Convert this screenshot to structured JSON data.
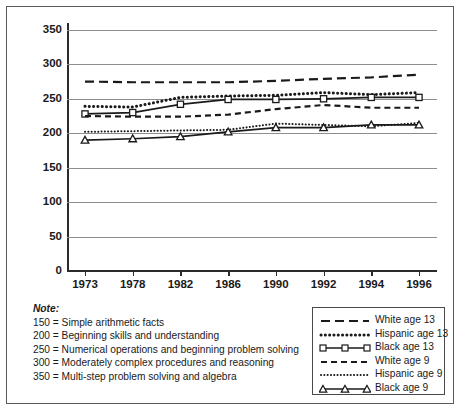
{
  "chart_data": {
    "type": "line",
    "title": "",
    "xlabel": "",
    "ylabel": "",
    "x": [
      1973,
      1978,
      1982,
      1986,
      1990,
      1992,
      1994,
      1996
    ],
    "xtick_labels": [
      "1973",
      "1978",
      "1982",
      "1986",
      "1990",
      "1992",
      "1994",
      "1996"
    ],
    "ylim": [
      0,
      360
    ],
    "ytick_labels": [
      "0",
      "50",
      "100",
      "150",
      "200",
      "250",
      "300",
      "350"
    ],
    "yticks": [
      0,
      50,
      100,
      150,
      200,
      250,
      300,
      350
    ],
    "grid": "horizontal",
    "legend_position": "bottom-right",
    "series": [
      {
        "name": "White age 13",
        "style": "long-dash",
        "marker": "none",
        "values": [
          275,
          274,
          274,
          274,
          276,
          279,
          281,
          285
        ]
      },
      {
        "name": "Hispanic age 13",
        "style": "bold-dotted",
        "marker": "none",
        "values": [
          239,
          238,
          252,
          254,
          255,
          259,
          256,
          259
        ]
      },
      {
        "name": "Black age 13",
        "style": "solid",
        "marker": "square",
        "values": [
          228,
          230,
          242,
          249,
          249,
          250,
          252,
          252
        ]
      },
      {
        "name": "White age 9",
        "style": "dashed",
        "marker": "none",
        "values": [
          225,
          224,
          224,
          227,
          235,
          241,
          237,
          237
        ]
      },
      {
        "name": "Hispanic age 9",
        "style": "fine-dotted",
        "marker": "none",
        "values": [
          202,
          203,
          204,
          205,
          214,
          212,
          210,
          215
        ]
      },
      {
        "name": "Black age 9",
        "style": "solid",
        "marker": "triangle",
        "values": [
          190,
          192,
          195,
          202,
          208,
          208,
          212,
          212
        ]
      }
    ]
  },
  "note": {
    "heading": "Note:",
    "lines": [
      "150 = Simple arithmetic facts",
      "200 = Beginning skills and understanding",
      "250 = Numerical operations and beginning problem solving",
      "300 = Moderately complex procedures and reasoning",
      "350 = Multi-step problem solving and algebra"
    ]
  },
  "legend": {
    "entries": [
      {
        "label": "White age 13"
      },
      {
        "label": "Hispanic age 13"
      },
      {
        "label": "Black age 13"
      },
      {
        "label": "White age 9"
      },
      {
        "label": "Hispanic age 9"
      },
      {
        "label": "Black age 9"
      }
    ]
  },
  "colors": {
    "line": "#1a1a1a",
    "grid": "#8d8d8d",
    "axis": "#2b2b2b",
    "frame": "#5a5a5a"
  }
}
